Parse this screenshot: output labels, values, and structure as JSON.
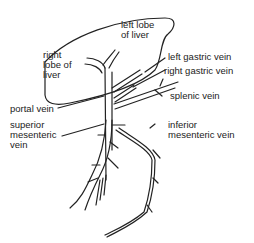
{
  "diagram": {
    "labels": {
      "left_lobe": "left lobe\nof liver",
      "right_lobe": "right\nlobe of\nliver",
      "left_gastric": "left gastric vein",
      "right_gastric": "right gastric vein",
      "splenic": "splenic vein",
      "portal": "portal vein",
      "superior_mesenteric": "superior\nmesenteric\nvein",
      "inferior_mesenteric": "inferior\nmesenteric vein"
    },
    "colors": {
      "line": "#222222",
      "background": "#ffffff"
    }
  }
}
